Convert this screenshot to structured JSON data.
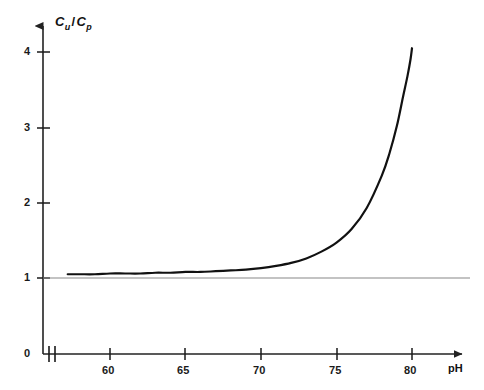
{
  "chart_data": {
    "type": "line",
    "title": "",
    "subtitle": "",
    "xlabel": "pH",
    "ylabel": "Cu / Cp",
    "ylabel_parts": {
      "numerator_base": "C",
      "numerator_sub": "u",
      "separator": "/",
      "denominator_base": "C",
      "denominator_sub": "p"
    },
    "xlim": [
      57.0,
      81.6
    ],
    "ylim": [
      0,
      4.55
    ],
    "xticks": [
      60,
      65,
      70,
      75,
      80
    ],
    "xtick_labels": [
      "60",
      "65",
      "70",
      "75",
      "80"
    ],
    "yticks": [
      1,
      2,
      3,
      4
    ],
    "ytick_labels": [
      "1",
      "2",
      "3",
      "4"
    ],
    "origin_label": "0",
    "grid": false,
    "legend": null,
    "axis_break": {
      "present": true,
      "axis": "x",
      "at_value": 57.5,
      "style": "double-slash"
    },
    "reference_line": {
      "value": 1,
      "orientation": "horizontal",
      "color": "#888888",
      "from_x": 57.0,
      "to_x": 81.3
    },
    "series": [
      {
        "name": "Cu/Cp",
        "color": "#111111",
        "line_width": 2.2,
        "x": [
          57.2,
          58,
          59,
          60,
          61,
          62,
          63,
          64,
          65,
          66,
          67,
          68,
          69,
          70,
          71,
          72,
          73,
          74,
          75,
          76,
          77,
          78,
          78.5,
          79,
          79.4,
          79.7,
          79.9,
          80.0
        ],
        "y": [
          1.05,
          1.05,
          1.05,
          1.06,
          1.06,
          1.06,
          1.07,
          1.07,
          1.08,
          1.08,
          1.09,
          1.1,
          1.11,
          1.13,
          1.16,
          1.2,
          1.26,
          1.35,
          1.47,
          1.65,
          1.93,
          2.36,
          2.65,
          3.02,
          3.4,
          3.68,
          3.9,
          4.05
        ]
      }
    ]
  },
  "axes": {
    "y_axis_arrow": true,
    "x_axis_arrow": true,
    "axis_color": "#222222"
  }
}
